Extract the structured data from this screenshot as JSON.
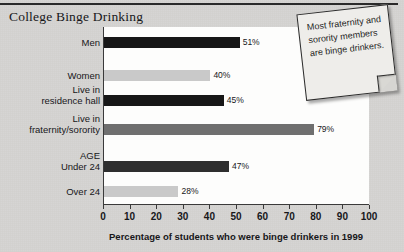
{
  "title": "College Binge Drinking",
  "colors": {
    "page_background": "#d6d5d2",
    "plot_background": "#fdfdfc",
    "bar_dark": "#171717",
    "bar_light": "#c9c9c9",
    "bar_medium": "#6f6f6f",
    "axis": "#3a3a3a",
    "note_background": "#eeedea",
    "text": "#17171a"
  },
  "note": {
    "text": "Most fraternity and sorority members are binge drinkers."
  },
  "chart_data": {
    "type": "bar",
    "orientation": "horizontal",
    "title": "College Binge Drinking",
    "xlabel": "Percentage of students who were binge drinkers in 1999",
    "ylabel": "",
    "xlim": [
      0,
      100
    ],
    "grid": false,
    "legend": "none",
    "xticks": [
      0,
      10,
      20,
      30,
      40,
      50,
      60,
      70,
      80,
      90,
      100
    ],
    "xtick_labels": [
      "0",
      "10",
      "20",
      "30",
      "40",
      "50",
      "60",
      "70",
      "80",
      "90",
      "100"
    ],
    "categories": [
      "Men",
      "Women",
      "Live in residence hall",
      "Live in fraternity/sorority",
      "AGE Under 24",
      "Over 24"
    ],
    "values": [
      51,
      40,
      45,
      79,
      47,
      28
    ],
    "value_labels": [
      "51%",
      "40%",
      "45%",
      "79%",
      "47%",
      "28%"
    ],
    "bars": [
      {
        "label": "Men",
        "label_line1": "Men",
        "label_line2": "",
        "value": 51,
        "value_label": "51%",
        "color": "#171717"
      },
      {
        "label": "Women",
        "label_line1": "Women",
        "label_line2": "",
        "value": 40,
        "value_label": "40%",
        "color": "#c9c9c9"
      },
      {
        "label": "Live in residence hall",
        "label_line1": "Live in",
        "label_line2": "residence hall",
        "value": 45,
        "value_label": "45%",
        "color": "#171717"
      },
      {
        "label": "Live in fraternity/sorority",
        "label_line1": "Live in",
        "label_line2": "fraternity/sorority",
        "value": 79,
        "value_label": "79%",
        "color": "#6f6f6f"
      },
      {
        "label": "AGE Under 24",
        "label_line1": "AGE",
        "label_line2": "Under 24",
        "value": 47,
        "value_label": "47%",
        "color": "#2e2e2e"
      },
      {
        "label": "Over 24",
        "label_line1": "Over 24",
        "label_line2": "",
        "value": 28,
        "value_label": "28%",
        "color": "#c9c9c9"
      }
    ],
    "annotations": [
      "Most fraternity and sorority members are binge drinkers."
    ]
  }
}
